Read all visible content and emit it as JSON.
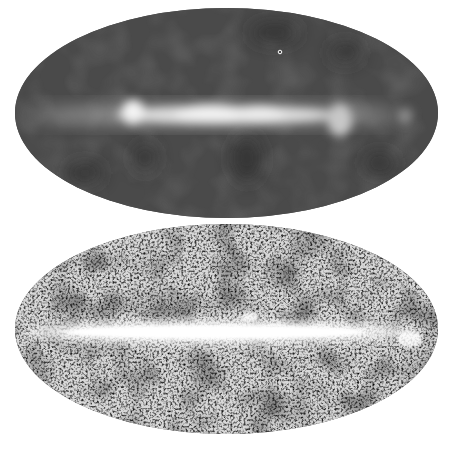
{
  "figure": {
    "panels": [
      {
        "id": "top",
        "description": "Smoothed all-sky map (Mollweide projection) with bright galactic plane band",
        "projection": "mollweide",
        "colors": {
          "background": "#4a4a4a",
          "band": "#e8e8e8",
          "dark_patch": "#2e2e2e"
        },
        "marker": {
          "shape": "small-circle",
          "x": 280,
          "y": 52
        }
      },
      {
        "id": "bottom",
        "description": "Noisy high-resolution all-sky map (Mollweide projection) with saturated galactic plane band",
        "projection": "mollweide",
        "colors": {
          "background": "#5a5a5a",
          "band": "#f4f4f4",
          "noise_dark": "#222222",
          "noise_light": "#dddddd"
        }
      }
    ]
  }
}
